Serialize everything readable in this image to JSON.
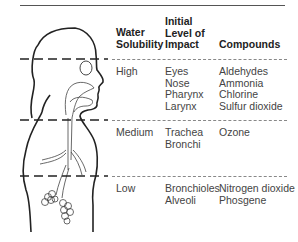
{
  "table": {
    "headers": {
      "solubility": "Water\nSolubility",
      "impact": "Initial\nLevel of\nImpact",
      "compounds": "Compounds"
    },
    "header_lines": {
      "solubility": [
        "Water",
        "Solubility"
      ],
      "impact": [
        "Initial",
        "Level of",
        "Impact"
      ],
      "compounds": [
        "Compounds"
      ]
    },
    "rows": [
      {
        "solubility": "High",
        "impact": [
          "Eyes",
          "Nose",
          "Pharynx",
          "Larynx"
        ],
        "compounds": [
          "Aldehydes",
          "Ammonia",
          "Chlorine",
          "Sulfur dioxide"
        ]
      },
      {
        "solubility": "Medium",
        "impact": [
          "Trachea",
          "Bronchi"
        ],
        "compounds": [
          "Ozone"
        ]
      },
      {
        "solubility": "Low",
        "impact": [
          "Bronchioles",
          "Alveoli"
        ],
        "compounds": [
          "Nitrogen dioxide",
          "Phosgene"
        ]
      }
    ]
  },
  "figure": {
    "icon": "human-respiratory-tract-silhouette"
  }
}
